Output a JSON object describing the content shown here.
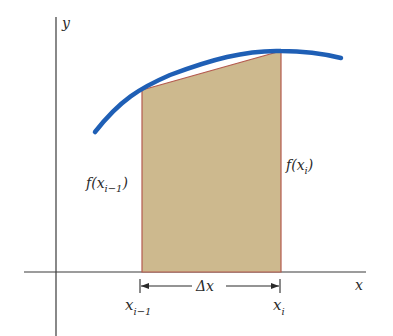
{
  "diagram": {
    "axes": {
      "x_label": "x",
      "y_label": "y"
    },
    "labels": {
      "f_left_main": "f(x",
      "f_left_sub": "i−1",
      "f_left_close": ")",
      "f_right_main": "f(x",
      "f_right_sub": "i",
      "f_right_close": ")",
      "x_left_main": "x",
      "x_left_sub": "i−1",
      "x_right_main": "x",
      "x_right_sub": "i",
      "delta_x": "Δx"
    },
    "colors": {
      "curve": "#1f5fb5",
      "trapezoid_fill": "#cdb98e",
      "trapezoid_edge": "#b45a4e",
      "axis": "#3a3a3a",
      "background": "#ffffff"
    }
  }
}
